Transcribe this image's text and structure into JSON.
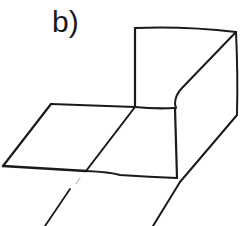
{
  "figure": {
    "label": "b)",
    "stroke_color": "#1a1a1a",
    "background": "#ffffff"
  },
  "parts": {
    "back_wall": "back-wall-panel",
    "side_wall": "curved-side-wall",
    "floor_left": "left-floor-panel",
    "floor_middle": "middle-floor-panel",
    "extension_lines": "foreground-extension-lines"
  }
}
